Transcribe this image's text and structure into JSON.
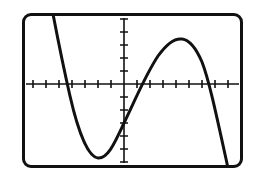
{
  "device": {
    "type": "graphing-calculator-screen",
    "frame_color": "#111111",
    "screen_background": "#ffffff",
    "frame": {
      "x": 22,
      "y": 13,
      "width": 221,
      "height": 155,
      "corner_radius": 9,
      "border_width": 3
    }
  },
  "chart_data": {
    "type": "line",
    "title": "",
    "subtitle": "",
    "xlabel": "",
    "ylabel": "",
    "legend": [],
    "legend_position": "none",
    "grid": false,
    "curve_color": "#111111",
    "curve_width": 3,
    "axis_color": "#111111",
    "axis_width": 1.6,
    "axes": {
      "x_axis_pixel_y": 84,
      "y_axis_pixel_x": 124,
      "tick_spacing_px": 13,
      "tick_length_px": 5,
      "x_tick_count_left": 7,
      "x_tick_count_right": 8,
      "y_tick_count_up": 5,
      "y_tick_count_down": 5
    },
    "xlim": [
      -8,
      9
    ],
    "ylim": [
      -6,
      6
    ],
    "features": {
      "x_intercepts": [
        -4.8,
        1.2,
        6.5
      ],
      "local_minimum": {
        "x": -2.1,
        "y": -5.7
      },
      "local_maximum": {
        "x": 4.4,
        "y": 3.5
      },
      "enters_window_top_left_at_x": -5.5,
      "exits_window_bottom_right_at_x": 8.0
    },
    "x": [
      -5.5,
      -5.0,
      -4.5,
      -4.0,
      -3.5,
      -3.0,
      -2.5,
      -2.0,
      -1.5,
      -1.0,
      -0.5,
      0.0,
      0.5,
      1.0,
      1.5,
      2.0,
      2.5,
      3.0,
      3.5,
      4.0,
      4.5,
      5.0,
      5.5,
      6.0,
      6.5,
      7.0,
      7.5,
      8.0
    ],
    "y": [
      6.0,
      2.0,
      -1.2,
      -3.3,
      -4.8,
      -5.5,
      -5.75,
      -5.7,
      -5.2,
      -4.4,
      -3.4,
      -2.3,
      -1.2,
      -0.1,
      0.8,
      1.6,
      2.3,
      2.9,
      3.3,
      3.45,
      3.5,
      3.3,
      2.8,
      1.8,
      0.2,
      -1.6,
      -3.9,
      -6.1
    ],
    "curve_path_pixels": "M 53,14 C 58,40 62,61 70,96 C 78,131 88,157 98,158 C 108,159 115,142 124,123 C 136,98 146,74 158,56 C 168,42 175,38 182,39 C 190,40 196,48 202,62 C 209,80 216,113 228,168"
  },
  "labels": {
    "screen_name": "calculator-graph-screen"
  }
}
